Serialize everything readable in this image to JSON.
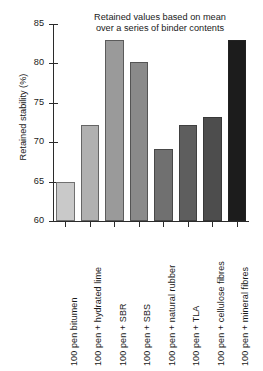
{
  "chart_data": {
    "type": "bar",
    "title": "Retained values based on mean\nover a series of binder contents",
    "xlabel": "",
    "ylabel": "Retained stability (%)",
    "ylim": [
      60,
      85
    ],
    "yticks": [
      60,
      65,
      70,
      75,
      80,
      85
    ],
    "ytick_labels": [
      "60",
      "65",
      "70",
      "75",
      "80",
      "85"
    ],
    "grid": false,
    "legend": false,
    "categories": [
      "100 pen bitumen",
      "100 pen + hydrated lime",
      "100 pen + SBR",
      "100 pen + SBS",
      "100 pen + natural rubber",
      "100 pen + TLA",
      "100 pen + cellulose fibres",
      "100 pen + mineral fibres"
    ],
    "values": [
      65.0,
      72.2,
      83.0,
      80.2,
      69.2,
      72.2,
      73.2,
      83.0
    ],
    "bar_colors": [
      "#c9c9c9",
      "#b0b0b0",
      "#9a9a9a",
      "#8a8a8a",
      "#707070",
      "#5e5e5e",
      "#4d4d4d",
      "#1c1c1c"
    ]
  }
}
